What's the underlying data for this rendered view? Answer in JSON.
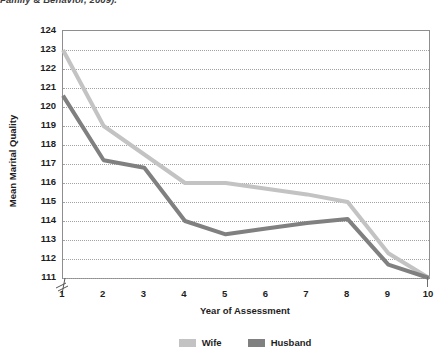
{
  "caption": {
    "text": "Family & Behavior, 2009)."
  },
  "chart_data": {
    "type": "line",
    "title": "",
    "xlabel": "Year of Assessment",
    "ylabel": "Mean Marital Quality",
    "x": [
      1,
      2,
      3,
      4,
      5,
      6,
      7,
      8,
      9,
      10
    ],
    "xticklabels": [
      "1",
      "2",
      "3",
      "4",
      "5",
      "6",
      "7",
      "8",
      "9",
      "10"
    ],
    "yticklabels": [
      "124",
      "123",
      "122",
      "121",
      "120",
      "119",
      "118",
      "117",
      "116",
      "115",
      "114",
      "113",
      "112",
      "111"
    ],
    "ylim": [
      111,
      124
    ],
    "xlim": [
      1,
      10
    ],
    "grid": "horizontal-dotted",
    "axis_break": "y-axis broken below 111",
    "legend_position": "bottom-center",
    "series": [
      {
        "name": "Wife",
        "color": "#c3c3c3",
        "values": [
          123.0,
          119.0,
          117.5,
          116.0,
          116.0,
          115.7,
          115.4,
          115.0,
          112.3,
          111.0
        ]
      },
      {
        "name": "Husband",
        "color": "#808080",
        "values": [
          120.6,
          117.2,
          116.8,
          114.0,
          113.3,
          113.6,
          113.9,
          114.1,
          111.7,
          111.0
        ]
      }
    ]
  },
  "legend": {
    "entries": [
      {
        "label": "Wife",
        "color": "#c3c3c3"
      },
      {
        "label": "Husband",
        "color": "#808080"
      }
    ]
  },
  "colors": {
    "wife": "#c3c3c3",
    "husband": "#808080",
    "gridline": "#a2a2a2",
    "border": "#8e8e8e",
    "text": "#1d1d1d"
  }
}
